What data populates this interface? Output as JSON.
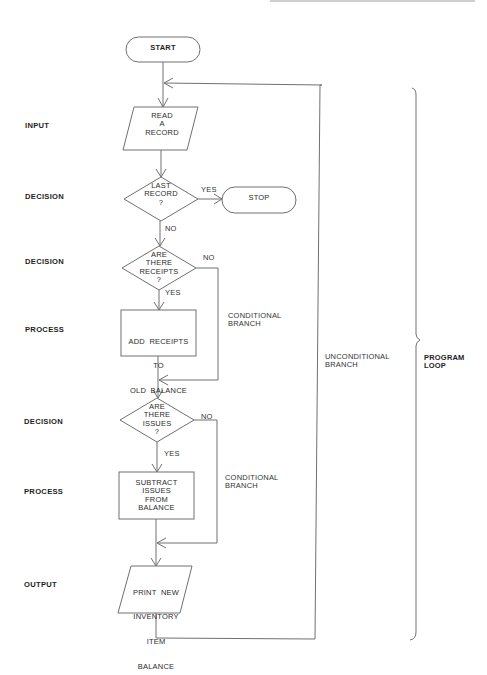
{
  "row_labels": {
    "input": "INPUT",
    "decision1": "DECISION",
    "decision2": "DECISION",
    "process1": "PROCESS",
    "decision3": "DECISION",
    "process2": "PROCESS",
    "output": "OUTPUT"
  },
  "nodes": {
    "start": "START",
    "read_record": [
      "READ",
      "A",
      "RECORD"
    ],
    "last_record": [
      "LAST",
      "RECORD",
      "?"
    ],
    "stop": "STOP",
    "receipts": [
      "ARE",
      "THERE",
      "RECEIPTS",
      "?"
    ],
    "add_receipts": [
      "ADD  RECEIPTS",
      "TO",
      "OLD  BALANCE"
    ],
    "issues": [
      "ARE",
      "THERE",
      "ISSUES",
      "?"
    ],
    "subtract_issues": [
      "SUBTRACT",
      "ISSUES",
      "FROM",
      "BALANCE"
    ],
    "print_balance": [
      "PRINT  NEW",
      "INVENTORY",
      "ITEM",
      "BALANCE"
    ]
  },
  "edge_labels": {
    "last_yes": "YES",
    "last_no": "NO",
    "receipts_no": "NO",
    "receipts_yes": "YES",
    "issues_no": "NO",
    "issues_yes": "YES"
  },
  "annotations": {
    "conditional_branch_1": [
      "CONDITIONAL",
      "BRANCH"
    ],
    "conditional_branch_2": [
      "CONDITIONAL",
      "BRANCH"
    ],
    "unconditional_branch": [
      "UNCONDITIONAL",
      "BRANCH"
    ],
    "program_loop": [
      "PROGRAM",
      "LOOP"
    ]
  },
  "colors": {
    "line": "#6b6b6b",
    "text": "#2b2b2b",
    "background": "#ffffff"
  }
}
